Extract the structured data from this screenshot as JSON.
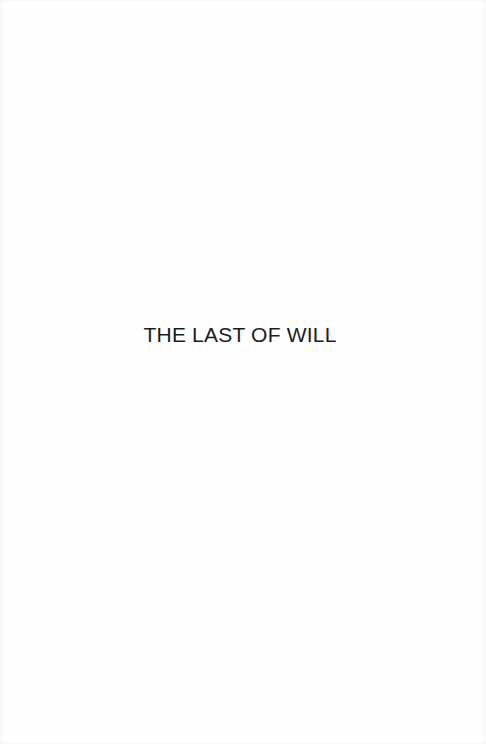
{
  "page": {
    "title": "THE LAST OF WILL",
    "background_color": "#fefefe",
    "text_color": "#1c1c1c"
  }
}
